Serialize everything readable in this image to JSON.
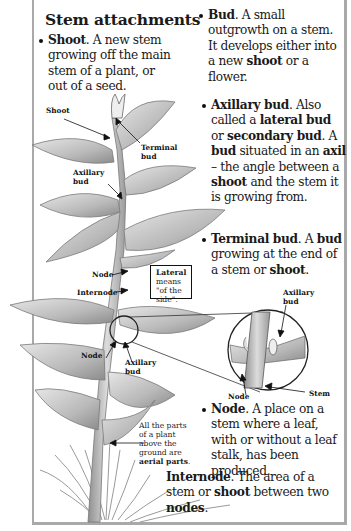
{
  "title": "Stem attachments",
  "definitions": {
    "shoot": {
      "term": "Shoot",
      "text": ". A new stem growing off the main stem of a plant, or out of a seed."
    },
    "bud": {
      "term": "Bud",
      "t1": ". A small outgrowth on a stem. It develops either into a new ",
      "k1": "shoot",
      "t2": " or a flower."
    },
    "axillary": {
      "term": "Axillary bud",
      "t1": ". Also called a ",
      "k1": "lateral bud",
      "t2": " or ",
      "k2": "secondary bud",
      "t3": ". A ",
      "k3": "bud",
      "t4": " situated in an ",
      "k4": "axil",
      "t5": " – the angle between a ",
      "k5": "shoot",
      "t6": " and the stem it is growing from."
    },
    "terminal": {
      "term": "Terminal bud",
      "t1": ". A ",
      "k1": "bud",
      "t2": " growing at the end of a stem or ",
      "k2": "shoot",
      "t3": "."
    },
    "node": {
      "term": "Node",
      "text": ". A place on a stem where a leaf, with or without a leaf stalk, has been produced."
    },
    "internode": {
      "term": "Internode",
      "t1": ". The area of a stem or ",
      "k1": "shoot",
      "t2": " between two ",
      "k2": "nodes",
      "t3": "."
    }
  },
  "labels": {
    "shoot": "Shoot",
    "terminal_bud_1": "Terminal",
    "terminal_bud_2": "bud",
    "axillary_bud_1": "Axillary",
    "axillary_bud_2": "bud",
    "node": "Node",
    "internode": "Internode",
    "node_lower": "Node",
    "axillary_lower_1": "Axillary",
    "axillary_lower_2": "bud",
    "inset_axillary_1": "Axillary",
    "inset_axillary_2": "bud",
    "inset_node": "Node",
    "inset_stem": "Stem"
  },
  "lateral_note": {
    "term": "Lateral",
    "text": "means \"of the side\"."
  },
  "aerial_note": {
    "text": "All the parts of a plant above the ground are",
    "term": "aerial parts",
    "end": "."
  },
  "colors": {
    "frame": "#a9a9a9",
    "leaf_fill": "#c9c9c9",
    "leaf_dark": "#8e8e8e",
    "stem": "#bdbdbd",
    "text": "#1a1a1a"
  }
}
